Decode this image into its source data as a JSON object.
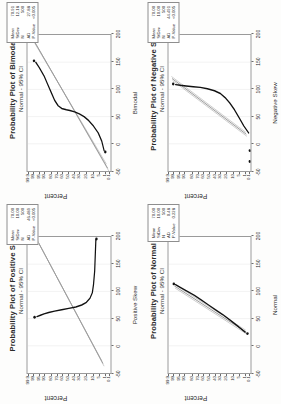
{
  "page": {
    "background": "#fdfdfc",
    "axis_color": "#2b2b2b",
    "fit_line_color": "#6f6f6f",
    "ci_line_color": "#9d9d9d",
    "data_color": "#111111"
  },
  "common": {
    "ylabel": "Percent",
    "subtitle": "Normal - 95% CI",
    "y_ticks": [
      "99.9",
      "99",
      "95",
      "90",
      "80",
      "70",
      "60",
      "50",
      "40",
      "30",
      "20",
      "10",
      "5",
      "1",
      "0.1"
    ],
    "x_ticks": [
      "-50",
      "0",
      "50",
      "100",
      "150",
      "200"
    ],
    "stat_keys": [
      "Mean",
      "StDev",
      "N",
      "AD",
      "P-Value"
    ]
  },
  "chart_data": [
    {
      "id": "positive-skew",
      "type": "scatter",
      "title": "Probability Plot of Positive Skew",
      "subtitle": "Normal - 95% CI",
      "xlabel": "Positive Skew",
      "ylabel": "Percent",
      "xlim": [
        -50,
        200
      ],
      "xticks": [
        "-50",
        "0",
        "50",
        "100",
        "150",
        "200"
      ],
      "yticks": [
        "99.9",
        "99",
        "95",
        "90",
        "80",
        "70",
        "60",
        "50",
        "40",
        "30",
        "20",
        "10",
        "5",
        "1",
        "0.1"
      ],
      "grid": true,
      "legend": "none",
      "stats": {
        "Mean": "70.00",
        "StDev": "10.00",
        "N": "500",
        "AD": "46.489",
        "P-Value": "<0.005"
      },
      "shape": "right-skewed: points hug low values then rise steeply at high percentiles"
    },
    {
      "id": "bimodal",
      "type": "scatter",
      "title": "Probability Plot of Bimodal",
      "subtitle": "Normal - 95% CI",
      "xlabel": "Bimodal",
      "ylabel": "Percent",
      "xlim": [
        -50,
        200
      ],
      "xticks": [
        "-50",
        "0",
        "50",
        "100",
        "150",
        "200"
      ],
      "yticks": [
        "99.9",
        "99",
        "95",
        "90",
        "80",
        "70",
        "60",
        "50",
        "40",
        "30",
        "20",
        "10",
        "5",
        "1",
        "0.1"
      ],
      "grid": true,
      "legend": "none",
      "stats": {
        "Mean": "70.91",
        "StDev": "12.18",
        "N": "500",
        "AD": "27.88",
        "P-Value": "<0.005"
      },
      "shape": "S-shaped / step in the middle indicating two modes"
    },
    {
      "id": "normal",
      "type": "scatter",
      "title": "Probability Plot of Normal",
      "subtitle": "Normal - 95% CI",
      "xlabel": "Normal",
      "ylabel": "Percent",
      "xlim": [
        -50,
        200
      ],
      "xticks": [
        "-50",
        "0",
        "50",
        "100",
        "150",
        "200"
      ],
      "yticks": [
        "99.9",
        "99",
        "95",
        "90",
        "80",
        "70",
        "60",
        "50",
        "40",
        "30",
        "20",
        "10",
        "5",
        "1",
        "0.1"
      ],
      "grid": true,
      "legend": "none",
      "stats": {
        "Mean": "70.00",
        "StDev": "10.00",
        "N": "500",
        "AD": "0.48",
        "P-Value": "0.228"
      },
      "shape": "straight line - points follow the fitted normal line closely"
    },
    {
      "id": "negative-skew",
      "type": "scatter",
      "title": "Probability Plot of Negative Skew",
      "subtitle": "Normal - 95% CI",
      "xlabel": "Negative Skew",
      "ylabel": "Percent",
      "xlim": [
        -50,
        200
      ],
      "xticks": [
        "-50",
        "0",
        "50",
        "100",
        "150",
        "200"
      ],
      "yticks": [
        "99.9",
        "99",
        "95",
        "90",
        "80",
        "70",
        "60",
        "50",
        "40",
        "30",
        "20",
        "10",
        "5",
        "1",
        "0.1"
      ],
      "grid": true,
      "legend": "none",
      "stats": {
        "Mean": "70.00",
        "StDev": "10.00",
        "N": "500",
        "AD": "44.491",
        "P-Value": "<0.005"
      },
      "shape": "left-skewed: points drop steeply at low percentiles then flatten"
    }
  ]
}
